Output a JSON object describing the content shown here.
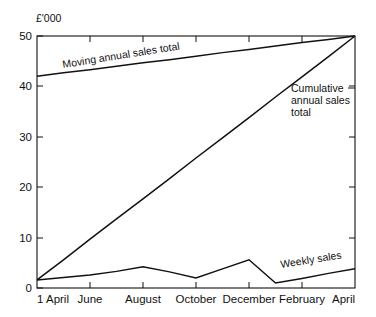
{
  "chart_data": {
    "type": "line",
    "title": "",
    "subtitle": "",
    "unit_label": "£'000",
    "xlabel": "",
    "ylabel": "",
    "ylim": [
      0,
      50
    ],
    "yticks": [
      0,
      10,
      20,
      30,
      40,
      50
    ],
    "ytick_labels": [
      "0",
      "10",
      "20",
      "30",
      "40",
      "50"
    ],
    "grid": false,
    "legend_position": "inline-annotations",
    "x": [
      "1 April",
      "May",
      "June",
      "July",
      "August",
      "September",
      "October",
      "November",
      "December",
      "January",
      "February",
      "March",
      "April"
    ],
    "xticks": [
      0,
      2,
      4,
      6,
      8,
      10,
      12
    ],
    "xtick_labels": [
      "1 April",
      "June",
      "August",
      "October",
      "December",
      "February",
      "April"
    ],
    "series": [
      {
        "name": "Moving annual sales total",
        "values": [
          42.0,
          42.7,
          43.3,
          44.0,
          44.7,
          45.3,
          46.0,
          46.7,
          47.3,
          48.0,
          48.7,
          49.3,
          50.0
        ],
        "label_placement": "along-line-upper-left",
        "label_rotation_deg": -9
      },
      {
        "name": "Cumulative annual sales total",
        "values": [
          1.6,
          5.6,
          9.7,
          13.7,
          17.7,
          21.7,
          25.8,
          29.8,
          33.8,
          37.9,
          41.9,
          45.9,
          50.0
        ],
        "label_placement": "right-of-line-upper-right",
        "label_lines": [
          "Cumulative",
          "annual sales",
          "total"
        ],
        "label_rotation_deg": 0
      },
      {
        "name": "Weekly sales",
        "values": [
          1.6,
          2.1,
          2.6,
          3.3,
          4.2,
          3.2,
          2.0,
          3.8,
          5.6,
          1.0,
          1.9,
          2.9,
          3.8
        ],
        "label_placement": "above-line-lower-right",
        "label_rotation_deg": -9
      }
    ],
    "annotations": [
      {
        "text": "Moving annual sales total",
        "series": "Moving annual sales total"
      },
      {
        "text": "Cumulative annual sales total",
        "series": "Cumulative annual sales total"
      },
      {
        "text": "Weekly sales",
        "series": "Weekly sales"
      }
    ],
    "colors": {
      "line": "#111111",
      "axis": "#111111",
      "background": "#ffffff",
      "text": "#111111"
    }
  }
}
